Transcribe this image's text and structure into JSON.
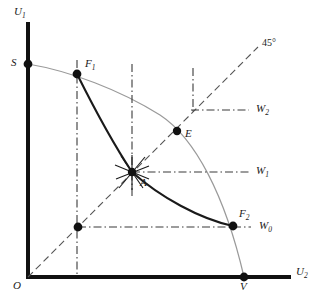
{
  "figure": {
    "type": "diagram",
    "background_color": "#ffffff",
    "axis_color": "#111111",
    "curve_dark_color": "#1a1a1a",
    "frontier_color": "#999999",
    "guide_color": "#555555",
    "width": 319,
    "height": 304
  },
  "axes": {
    "vertical": {
      "name": "U1",
      "label": "U",
      "subscript": "1",
      "label_x": 14,
      "label_y": 6,
      "x": 28,
      "y_top": 22,
      "y_bottom": 277
    },
    "horizontal": {
      "name": "U2",
      "label": "U",
      "subscript": "2",
      "label_x": 296,
      "label_y": 268,
      "y": 277,
      "x_left": 28,
      "x_right": 291
    },
    "origin": {
      "label": "O",
      "label_x": 13,
      "label_y": 282,
      "x": 28,
      "y": 277
    }
  },
  "diagonal": {
    "label": "45°",
    "label_x": 262,
    "label_y": 38,
    "from": {
      "x": 28,
      "y": 277
    },
    "to": {
      "x": 258,
      "y": 47
    }
  },
  "points": [
    {
      "id": "S",
      "label": "S",
      "x": 28,
      "y": 64,
      "label_x": 12,
      "label_y": 58,
      "filled": true
    },
    {
      "id": "F1",
      "label": "F",
      "subscript": "1",
      "x": 77,
      "y": 74,
      "label_x": 85,
      "label_y": 59,
      "filled": true
    },
    {
      "id": "A",
      "label": "A",
      "x": 132,
      "y": 172,
      "label_x": 139,
      "label_y": 177,
      "filled": true
    },
    {
      "id": "E",
      "label": "E",
      "x": 177,
      "y": 131,
      "label_x": 185,
      "label_y": 129,
      "filled": true
    },
    {
      "id": "F2",
      "label": "F",
      "subscript": "2",
      "x": 233,
      "y": 226,
      "label_x": 239,
      "label_y": 209,
      "filled": true
    },
    {
      "id": "V",
      "label": "V",
      "x": 244,
      "y": 277,
      "label_x": 240,
      "label_y": 282,
      "filled": true
    },
    {
      "id": "D0",
      "label": "",
      "x": 78,
      "y": 227,
      "label_x": 0,
      "label_y": 0,
      "filled": true
    }
  ],
  "welfare_levels": [
    {
      "id": "W2",
      "label": "W",
      "subscript": "2",
      "y": 110,
      "x_start": 193,
      "x_end": 249,
      "label_x": 255,
      "label_y": 104
    },
    {
      "id": "W1",
      "label": "W",
      "subscript": "1",
      "y": 172,
      "x_start": 132,
      "x_end": 249,
      "label_x": 255,
      "label_y": 166
    },
    {
      "id": "W0",
      "label": "W",
      "subscript": "0",
      "y": 227,
      "x_start": 78,
      "x_end": 251,
      "label_x": 258,
      "label_y": 221
    }
  ],
  "vertical_guides": [
    {
      "id": "guide-F1",
      "x": 77,
      "y_top": 60,
      "y_bottom": 277
    },
    {
      "id": "guide-A",
      "x": 132,
      "y_top": 64,
      "y_bottom": 195
    },
    {
      "id": "guide-E",
      "x": 193,
      "y_top": 68,
      "y_bottom": 113
    }
  ],
  "curves": {
    "frontier": {
      "id": "utility-possibility-frontier",
      "style": "thin-gray",
      "path": "M 28 64 C 70 71, 120 90, 160 115 C 195 138, 225 195, 244 277"
    },
    "contract_curve": {
      "id": "contract-curve",
      "style": "thick-dark",
      "path": "M 77 74 C 92 104, 112 142, 132 172 C 160 197, 200 219, 233 226"
    }
  },
  "star_marker": {
    "at_point": "A",
    "rays": 6,
    "radius": 17
  }
}
